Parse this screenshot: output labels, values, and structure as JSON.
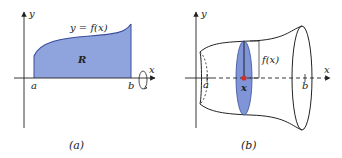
{
  "panel_a": {
    "caption": "(a)",
    "y_axis_label": "y",
    "x_axis_label": "x",
    "curve_label": "y = f(x)",
    "region_label": "R",
    "left_bound_label": "a",
    "right_bound_label": "b",
    "region_fill": "#8FA3DD",
    "curve_color": "#3A4F9A"
  },
  "panel_b": {
    "caption": "(b)",
    "y_axis_label": "y",
    "x_axis_label": "x",
    "radius_label": "f(x)",
    "point_label": "x",
    "left_bound_label": "a",
    "right_bound_label": "b",
    "disk_fill": "#7F95D8",
    "point_color": "#D0302A"
  }
}
